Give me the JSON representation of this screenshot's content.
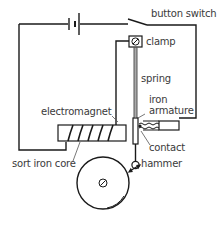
{
  "diagram": {
    "labels": {
      "button_switch": "button switch",
      "clamp": "clamp",
      "spring": "spring",
      "iron_armature_line1": "iron",
      "iron_armature_line2": "armature",
      "electromagnet": "electromagnet",
      "contact": "contact",
      "sort_iron_core": "sort iron core",
      "hammer": "hammer"
    },
    "components": [
      {
        "id": "battery",
        "icon": "battery-cell-icon"
      },
      {
        "id": "button-switch",
        "icon": "switch-icon"
      },
      {
        "id": "clamp",
        "icon": "screw-clamp-icon"
      },
      {
        "id": "spring",
        "icon": "spring-icon"
      },
      {
        "id": "iron-armature",
        "icon": "armature-icon"
      },
      {
        "id": "contact",
        "icon": "contact-screw-icon"
      },
      {
        "id": "electromagnet",
        "icon": "coil-icon"
      },
      {
        "id": "soft-iron-core",
        "icon": "core-icon"
      },
      {
        "id": "hammer",
        "icon": "hammer-icon"
      },
      {
        "id": "bell-gong",
        "icon": "gong-icon"
      }
    ],
    "colors": {
      "line": "#1a1a1a",
      "text": "#3a3a3a",
      "background": "#ffffff"
    }
  }
}
